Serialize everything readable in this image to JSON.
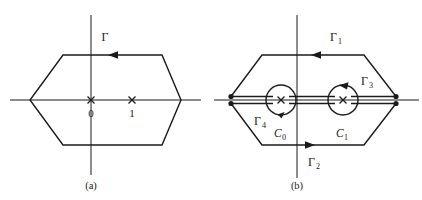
{
  "figure": {
    "type": "complex-contour-diagram",
    "background_color": "#ffffff",
    "ink_color": "#1a1a1a",
    "panels": [
      {
        "id": "a",
        "caption": "(a)",
        "description": "Hexagonal contour in the complex plane enclosing the poles at 0 and 1",
        "contour_labels": [
          {
            "name": "gamma",
            "text": "Γ",
            "subscript": ""
          }
        ],
        "poles": [
          {
            "label": "0",
            "marker": "x"
          },
          {
            "label": "1",
            "marker": "x"
          }
        ],
        "orientation": "clockwise-top-leftward"
      },
      {
        "id": "b",
        "caption": "(b)",
        "description": "Deformed hexagonal contour with a slit along the real axis and small circles around each pole",
        "contour_labels": [
          {
            "name": "gamma-1",
            "text": "Γ",
            "subscript": "1"
          },
          {
            "name": "gamma-2",
            "text": "Γ",
            "subscript": "2"
          },
          {
            "name": "gamma-3",
            "text": "Γ",
            "subscript": "3"
          },
          {
            "name": "gamma-4",
            "text": "Γ",
            "subscript": "4"
          }
        ],
        "circle_labels": [
          {
            "name": "c-0",
            "text": "C",
            "subscript": "0"
          },
          {
            "name": "c-1",
            "text": "C",
            "subscript": "1"
          }
        ],
        "poles": [
          {
            "label": "",
            "marker": "x"
          },
          {
            "label": "",
            "marker": "x"
          }
        ],
        "endpoint_dots": 4,
        "orientation": "clockwise-top-leftward"
      }
    ]
  }
}
